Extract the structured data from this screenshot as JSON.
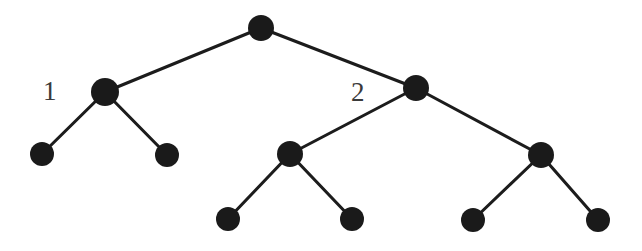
{
  "figure": {
    "type": "binary-tree-diagram",
    "background_color": "#ffffff",
    "node_color": "#1a1a1a",
    "edge_color": "#1c1c1c",
    "label_color": "#3a3a3a",
    "width": 642,
    "height": 251
  },
  "labels": {
    "left_subtree": "1",
    "right_subtree": "2"
  },
  "nodes": [
    {
      "id": "root",
      "label": "",
      "cx": 261,
      "cy": 28,
      "r": 13,
      "level": 0
    },
    {
      "id": "n1",
      "label": "1",
      "cx": 105,
      "cy": 92,
      "r": 14,
      "level": 1
    },
    {
      "id": "n2",
      "label": "2",
      "cx": 416,
      "cy": 88,
      "r": 13,
      "level": 1
    },
    {
      "id": "n1a",
      "label": "",
      "cx": 42,
      "cy": 154,
      "r": 12,
      "level": 2
    },
    {
      "id": "n1b",
      "label": "",
      "cx": 167,
      "cy": 155,
      "r": 12,
      "level": 2
    },
    {
      "id": "n2a",
      "label": "",
      "cx": 290,
      "cy": 154,
      "r": 13,
      "level": 2
    },
    {
      "id": "n2b",
      "label": "",
      "cx": 541,
      "cy": 155,
      "r": 13,
      "level": 2
    },
    {
      "id": "n2a1",
      "label": "",
      "cx": 228,
      "cy": 219,
      "r": 12,
      "level": 3
    },
    {
      "id": "n2a2",
      "label": "",
      "cx": 352,
      "cy": 219,
      "r": 12,
      "level": 3
    },
    {
      "id": "n2b1",
      "label": "",
      "cx": 473,
      "cy": 220,
      "r": 12,
      "level": 3
    },
    {
      "id": "n2b2",
      "label": "",
      "cx": 598,
      "cy": 220,
      "r": 12,
      "level": 3
    }
  ],
  "edges": [
    {
      "from": "root",
      "to": "n1",
      "x1": 261,
      "y1": 28,
      "x2": 105,
      "y2": 92
    },
    {
      "from": "root",
      "to": "n2",
      "x1": 261,
      "y1": 28,
      "x2": 416,
      "y2": 88
    },
    {
      "from": "n1",
      "to": "n1a",
      "x1": 105,
      "y1": 92,
      "x2": 42,
      "y2": 154
    },
    {
      "from": "n1",
      "to": "n1b",
      "x1": 105,
      "y1": 92,
      "x2": 167,
      "y2": 155
    },
    {
      "from": "n2",
      "to": "n2a",
      "x1": 416,
      "y1": 88,
      "x2": 290,
      "y2": 154
    },
    {
      "from": "n2",
      "to": "n2b",
      "x1": 416,
      "y1": 88,
      "x2": 541,
      "y2": 155
    },
    {
      "from": "n2a",
      "to": "n2a1",
      "x1": 290,
      "y1": 154,
      "x2": 228,
      "y2": 219
    },
    {
      "from": "n2a",
      "to": "n2a2",
      "x1": 290,
      "y1": 154,
      "x2": 352,
      "y2": 219
    },
    {
      "from": "n2b",
      "to": "n2b1",
      "x1": 541,
      "y1": 155,
      "x2": 473,
      "y2": 220
    },
    {
      "from": "n2b",
      "to": "n2b2",
      "x1": 541,
      "y1": 155,
      "x2": 598,
      "y2": 220
    }
  ]
}
